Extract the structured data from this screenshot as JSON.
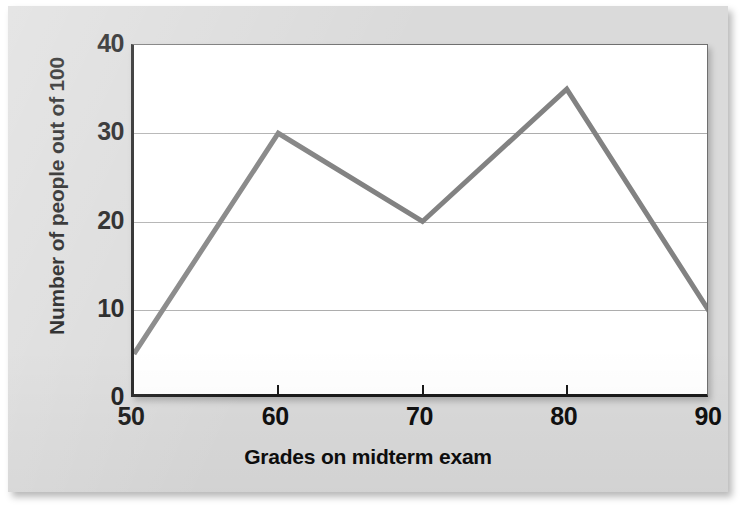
{
  "chart_data": {
    "type": "line",
    "title": "",
    "subtitle": "",
    "xlabel": "Grades on midterm exam",
    "ylabel": "Number of people out of 100",
    "x": [
      50,
      60,
      70,
      80,
      90
    ],
    "values": [
      5,
      30,
      20,
      35,
      9.5
    ],
    "series": [
      {
        "name": "Number of people out of 100",
        "values": [
          5,
          30,
          20,
          35,
          9.5
        ],
        "color": "#828282"
      }
    ],
    "xlim": [
      50,
      90
    ],
    "ylim": [
      0,
      40
    ],
    "xticks": [
      "50",
      "60",
      "70",
      "80",
      "90"
    ],
    "yticks": [
      "0",
      "10",
      "20",
      "30",
      "40"
    ],
    "gridlines_y": [
      10,
      20,
      30
    ],
    "grid": "horizontal-only",
    "legend": "none",
    "marker": "none",
    "line_width": 5
  },
  "figure": {
    "panel_background": "#dadada",
    "plot_background": "#ffffff",
    "axis_color": "#1a1a1a",
    "grid_color": "#adadad",
    "line_color": "#828282",
    "text_color": "#0d0d0d"
  }
}
